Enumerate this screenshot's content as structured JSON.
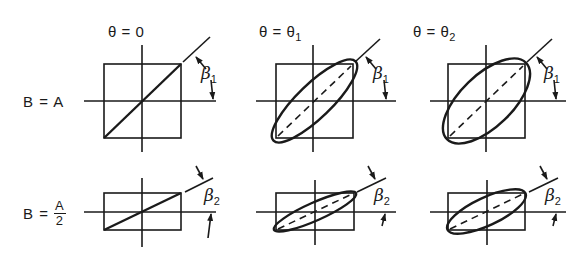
{
  "columns": [
    {
      "title_main": "θ = 0",
      "title_sub": "",
      "ellipse": "none"
    },
    {
      "title_main": "θ = θ",
      "title_sub": "1",
      "ellipse": "narrow"
    },
    {
      "title_main": "θ = θ",
      "title_sub": "2",
      "ellipse": "wide"
    }
  ],
  "rows": [
    {
      "label_prefix": "B = ",
      "label_value": "A",
      "angle_symbol": "β",
      "angle_sub": "1"
    },
    {
      "label_prefix": "B = ",
      "label_numerator": "A",
      "label_denominator": "2",
      "angle_symbol": "β",
      "angle_sub": "2"
    }
  ],
  "colors": {
    "ink": "#1a1a1a",
    "background": "#ffffff"
  }
}
